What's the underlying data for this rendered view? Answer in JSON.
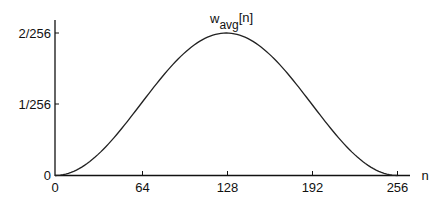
{
  "chart_data": {
    "type": "line",
    "title_main": "w",
    "title_sub": "avg",
    "title_suffix": "[n]",
    "xlabel": "n",
    "ylabel": "",
    "x_ticks": [
      "0",
      "64",
      "128",
      "192",
      "256"
    ],
    "x_tick_values": [
      0,
      64,
      128,
      192,
      256
    ],
    "y_ticks": [
      "0",
      "1/256",
      "2/256"
    ],
    "y_tick_values": [
      0,
      0.00390625,
      0.0078125
    ],
    "xlim": [
      0,
      256
    ],
    "ylim": [
      0,
      0.0078125
    ],
    "grid": false,
    "legend": null,
    "series": [
      {
        "name": "w_avg[n]",
        "formula": "(1/256)*(1 - cos(2*pi*n/256))",
        "x": [
          0,
          16,
          32,
          48,
          64,
          80,
          96,
          112,
          128,
          144,
          160,
          176,
          192,
          208,
          224,
          240,
          256
        ],
        "values": [
          0,
          0.000297,
          0.001144,
          0.002411,
          0.003906,
          0.005401,
          0.006668,
          0.007516,
          0.0078125,
          0.007516,
          0.006668,
          0.005401,
          0.003906,
          0.002411,
          0.001144,
          0.000297,
          0
        ]
      }
    ]
  }
}
